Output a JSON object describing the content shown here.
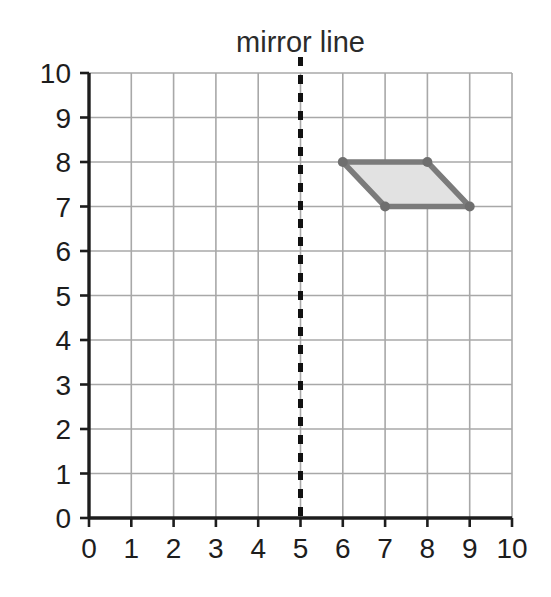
{
  "title": "mirror line",
  "colors": {
    "background": "#ffffff",
    "axis": "#1d1d1d",
    "grid": "#a8a8a8",
    "mirror_line": "#111111",
    "shape_stroke": "#7b7b7b",
    "shape_fill": "#e2e2e2",
    "vertex": "#6f6f6f",
    "text": "#1d1d1d"
  },
  "chart_data": {
    "type": "scatter",
    "title": "mirror line",
    "xlabel": "",
    "ylabel": "",
    "xlim": [
      0,
      10
    ],
    "ylim": [
      0,
      10
    ],
    "grid": true,
    "legend": "none",
    "x_ticks": [
      "0",
      "1",
      "2",
      "3",
      "4",
      "5",
      "6",
      "7",
      "8",
      "9",
      "10"
    ],
    "y_ticks": [
      "0",
      "1",
      "2",
      "3",
      "4",
      "5",
      "6",
      "7",
      "8",
      "9",
      "10"
    ],
    "x_tick_values": [
      0,
      1,
      2,
      3,
      4,
      5,
      6,
      7,
      8,
      9,
      10
    ],
    "y_tick_values": [
      0,
      1,
      2,
      3,
      4,
      5,
      6,
      7,
      8,
      9,
      10
    ],
    "annotations": [
      {
        "name": "mirror-line",
        "label": "mirror line",
        "orientation": "vertical",
        "x": 5,
        "style": "dashed",
        "y_from": 0,
        "y_to": 10
      }
    ],
    "shapes": [
      {
        "name": "parallelogram",
        "kind": "polygon",
        "closed": true,
        "vertices": [
          {
            "x": 6,
            "y": 8
          },
          {
            "x": 8,
            "y": 8
          },
          {
            "x": 9,
            "y": 7
          },
          {
            "x": 7,
            "y": 7
          }
        ],
        "vertex_labels": [
          "(6,8)",
          "(8,8)",
          "(9,7)",
          "(7,7)"
        ],
        "fill": "#e2e2e2",
        "stroke": "#7b7b7b"
      }
    ]
  },
  "geometry": {
    "origin_px": {
      "x": 89,
      "y": 518
    },
    "unit_px": {
      "x": 42.3,
      "y": 44.5
    }
  }
}
